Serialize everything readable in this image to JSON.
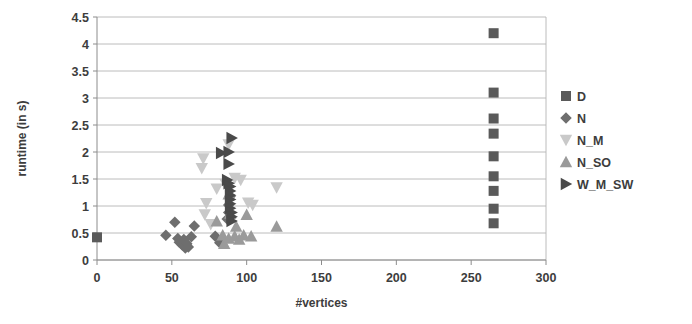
{
  "chart_data": {
    "type": "scatter",
    "title": "",
    "xlabel": "#vertices",
    "ylabel": "runtime (in s)",
    "xlim": [
      0,
      300
    ],
    "ylim": [
      0,
      4.5
    ],
    "xticks": [
      0,
      50,
      100,
      150,
      200,
      250,
      300
    ],
    "xtick_labels": [
      "0",
      "50",
      "100",
      "150",
      "200",
      "250",
      "300"
    ],
    "yticks": [
      0,
      0.5,
      1,
      1.5,
      2,
      2.5,
      3,
      3.5,
      4,
      4.5
    ],
    "ytick_labels": [
      "0",
      "0.5",
      "1",
      "1.5",
      "2",
      "2.5",
      "3",
      "3.5",
      "4",
      "4.5"
    ],
    "grid": "horizontal",
    "legend_position": "right",
    "series": [
      {
        "name": "D",
        "marker": "square",
        "color": "#5a5a5a",
        "points": [
          [
            0,
            0.42
          ],
          [
            265,
            4.2
          ],
          [
            265,
            3.1
          ],
          [
            265,
            2.62
          ],
          [
            265,
            2.34
          ],
          [
            265,
            1.92
          ],
          [
            265,
            1.55
          ],
          [
            265,
            1.28
          ],
          [
            265,
            0.95
          ],
          [
            265,
            0.68
          ]
        ]
      },
      {
        "name": "N",
        "marker": "diamond",
        "color": "#6e6e6e",
        "points": [
          [
            46,
            0.46
          ],
          [
            52,
            0.7
          ],
          [
            54,
            0.4
          ],
          [
            55,
            0.33
          ],
          [
            57,
            0.28
          ],
          [
            58,
            0.38
          ],
          [
            59,
            0.22
          ],
          [
            60,
            0.3
          ],
          [
            61,
            0.24
          ],
          [
            63,
            0.43
          ],
          [
            65,
            0.63
          ],
          [
            79,
            0.44
          ],
          [
            82,
            0.32
          ],
          [
            87,
            0.76
          ],
          [
            88,
            0.88
          ],
          [
            88,
            1.02
          ],
          [
            89,
            1.18
          ]
        ]
      },
      {
        "name": "N_M",
        "marker": "triangle-down",
        "color": "#c9c9c9",
        "points": [
          [
            70,
            1.7
          ],
          [
            71,
            1.88
          ],
          [
            72,
            0.84
          ],
          [
            73,
            1.05
          ],
          [
            76,
            0.66
          ],
          [
            80,
            1.32
          ],
          [
            86,
            1.4
          ],
          [
            88,
            2.14
          ],
          [
            92,
            1.52
          ],
          [
            96,
            1.48
          ],
          [
            101,
            1.06
          ],
          [
            104,
            1.02
          ],
          [
            120,
            1.34
          ]
        ]
      },
      {
        "name": "N_SO",
        "marker": "triangle-up",
        "color": "#9a9a9a",
        "points": [
          [
            80,
            0.72
          ],
          [
            84,
            0.46
          ],
          [
            85,
            0.3
          ],
          [
            88,
            0.4
          ],
          [
            88,
            1.22
          ],
          [
            89,
            0.86
          ],
          [
            92,
            0.44
          ],
          [
            93,
            0.62
          ],
          [
            95,
            0.38
          ],
          [
            98,
            0.46
          ],
          [
            100,
            0.84
          ],
          [
            103,
            0.44
          ],
          [
            120,
            0.62
          ]
        ]
      },
      {
        "name": "W_M_SW",
        "marker": "triangle-right",
        "color": "#4a4a4a",
        "points": [
          [
            83,
            1.98
          ],
          [
            88,
            2.0
          ],
          [
            90,
            2.26
          ],
          [
            88,
            1.78
          ],
          [
            87,
            1.48
          ],
          [
            88,
            1.42
          ],
          [
            89,
            1.36
          ],
          [
            89,
            1.28
          ],
          [
            89,
            1.2
          ],
          [
            89,
            1.12
          ],
          [
            89,
            1.04
          ],
          [
            89,
            0.96
          ],
          [
            90,
            0.88
          ],
          [
            90,
            0.8
          ],
          [
            90,
            0.72
          ]
        ]
      }
    ]
  },
  "legend": {
    "items": [
      {
        "label": "D"
      },
      {
        "label": "N"
      },
      {
        "label": "N_M"
      },
      {
        "label": "N_SO"
      },
      {
        "label": "W_M_SW"
      }
    ]
  }
}
